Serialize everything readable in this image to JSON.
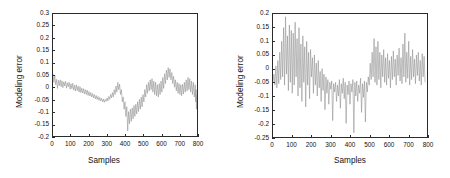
{
  "figure": {
    "background": "#ffffff",
    "trace_color": "#8c8c8c",
    "axis_color": "#2b2b2b"
  },
  "chart_data": [
    {
      "id": "left",
      "type": "line",
      "title": "",
      "xlabel": "Samples",
      "ylabel": "Modeling error",
      "xlim": [
        0,
        800
      ],
      "ylim": [
        -0.2,
        0.3
      ],
      "xticks": [
        0,
        100,
        200,
        300,
        400,
        500,
        600,
        700,
        800
      ],
      "xticklabels": [
        "0",
        "100",
        "200",
        "300",
        "400",
        "500",
        "600",
        "700",
        "800"
      ],
      "yticks": [
        -0.2,
        -0.15,
        -0.1,
        -0.05,
        0,
        0.05,
        0.1,
        0.15,
        0.2,
        0.25,
        0.3
      ],
      "yticklabels": [
        "-0.2",
        "-0.15",
        "-0.1",
        "-0.05",
        "0",
        "0.05",
        "0.1",
        "0.15",
        "0.2",
        "0.25",
        "0.3"
      ],
      "grid": false,
      "legend": null,
      "series": [
        {
          "name": "modeling error",
          "color": "#8c8c8c",
          "x": [
            0,
            5,
            10,
            15,
            20,
            25,
            30,
            35,
            40,
            45,
            50,
            55,
            60,
            65,
            70,
            75,
            80,
            85,
            90,
            95,
            100,
            105,
            110,
            115,
            120,
            125,
            130,
            135,
            140,
            145,
            150,
            155,
            160,
            165,
            170,
            175,
            180,
            185,
            190,
            195,
            200,
            205,
            210,
            215,
            220,
            225,
            230,
            235,
            240,
            245,
            250,
            255,
            260,
            265,
            270,
            275,
            280,
            285,
            290,
            295,
            300,
            305,
            310,
            315,
            320,
            325,
            330,
            335,
            340,
            345,
            350,
            355,
            360,
            365,
            370,
            375,
            380,
            385,
            390,
            395,
            400,
            405,
            410,
            415,
            420,
            425,
            430,
            435,
            440,
            445,
            450,
            455,
            460,
            465,
            470,
            475,
            480,
            485,
            490,
            495,
            500,
            505,
            510,
            515,
            520,
            525,
            530,
            535,
            540,
            545,
            550,
            555,
            560,
            565,
            570,
            575,
            580,
            585,
            590,
            595,
            600,
            605,
            610,
            615,
            620,
            625,
            630,
            635,
            640,
            645,
            650,
            655,
            660,
            665,
            670,
            675,
            680,
            685,
            690,
            695,
            700,
            705,
            710,
            715,
            720,
            725,
            730,
            735,
            740,
            745,
            750,
            755,
            760,
            765,
            770,
            775,
            780,
            785,
            790,
            793,
            795,
            797,
            799
          ],
          "y": [
            0.055,
            0.02,
            0.048,
            0.01,
            0.032,
            -0.005,
            0.028,
            0.006,
            0.03,
            0.002,
            0.026,
            -0.002,
            0.022,
            0.005,
            0.024,
            -0.004,
            0.018,
            0.002,
            0.02,
            -0.008,
            0.014,
            -0.006,
            0.016,
            -0.012,
            0.008,
            -0.016,
            0.01,
            -0.014,
            0.004,
            -0.02,
            0.002,
            -0.022,
            -0.004,
            -0.024,
            -0.006,
            -0.028,
            -0.01,
            -0.03,
            -0.012,
            -0.034,
            -0.018,
            -0.036,
            -0.022,
            -0.04,
            -0.026,
            -0.044,
            -0.03,
            -0.048,
            -0.034,
            -0.05,
            -0.038,
            -0.054,
            -0.042,
            -0.056,
            -0.046,
            -0.06,
            -0.048,
            -0.062,
            -0.05,
            -0.058,
            -0.044,
            -0.056,
            -0.038,
            -0.05,
            -0.03,
            -0.044,
            -0.022,
            -0.04,
            -0.01,
            -0.03,
            0.005,
            -0.02,
            0.02,
            -0.01,
            0.012,
            -0.03,
            -0.01,
            -0.06,
            -0.04,
            -0.09,
            -0.06,
            -0.12,
            -0.08,
            -0.18,
            -0.1,
            -0.15,
            -0.09,
            -0.14,
            -0.085,
            -0.13,
            -0.075,
            -0.12,
            -0.07,
            -0.11,
            -0.06,
            -0.1,
            -0.05,
            -0.09,
            -0.04,
            -0.08,
            -0.03,
            -0.06,
            -0.01,
            -0.04,
            0.01,
            -0.025,
            0.02,
            -0.015,
            0.03,
            -0.01,
            0.035,
            -0.02,
            0.025,
            -0.03,
            0.02,
            -0.035,
            0.01,
            -0.04,
            0.015,
            -0.03,
            0.025,
            -0.02,
            0.04,
            -0.005,
            0.055,
            0.015,
            0.07,
            0.03,
            0.08,
            0.04,
            0.075,
            0.03,
            0.06,
            0.015,
            0.045,
            0.0,
            0.03,
            -0.015,
            0.02,
            -0.025,
            0.015,
            -0.03,
            0.01,
            -0.035,
            0.012,
            -0.028,
            0.02,
            -0.02,
            0.03,
            -0.015,
            0.04,
            -0.01,
            0.035,
            -0.02,
            0.025,
            -0.03,
            0.02,
            -0.04,
            0.01,
            -0.06,
            -0.01,
            -0.09,
            -0.03,
            -0.125,
            -0.05,
            0.01,
            0.05,
            0.09,
            0.06,
            0.1,
            0.18,
            0.3
          ]
        }
      ]
    },
    {
      "id": "right",
      "type": "line",
      "title": "",
      "xlabel": "Samples",
      "ylabel": "Modeling error",
      "xlim": [
        0,
        800
      ],
      "ylim": [
        -0.25,
        0.2
      ],
      "xticks": [
        0,
        100,
        200,
        300,
        400,
        500,
        600,
        700,
        800
      ],
      "xticklabels": [
        "0",
        "100",
        "200",
        "300",
        "400",
        "500",
        "600",
        "700",
        "800"
      ],
      "yticks": [
        -0.25,
        -0.2,
        -0.15,
        -0.1,
        -0.05,
        0,
        0.05,
        0.1,
        0.15,
        0.2
      ],
      "yticklabels": [
        "-0.25",
        "-0.2",
        "-0.15",
        "-0.1",
        "-0.05",
        "0",
        "0.05",
        "0.1",
        "0.15",
        "0.2"
      ],
      "grid": false,
      "legend": null,
      "series": [
        {
          "name": "modeling error",
          "color": "#8c8c8c",
          "x": [
            0,
            5,
            10,
            15,
            20,
            25,
            30,
            35,
            40,
            45,
            50,
            55,
            60,
            65,
            70,
            75,
            80,
            85,
            90,
            95,
            100,
            105,
            110,
            115,
            120,
            125,
            130,
            135,
            140,
            145,
            150,
            155,
            160,
            165,
            170,
            175,
            180,
            185,
            190,
            195,
            200,
            205,
            210,
            215,
            220,
            225,
            230,
            235,
            240,
            245,
            250,
            255,
            260,
            265,
            270,
            275,
            280,
            285,
            290,
            295,
            300,
            305,
            310,
            315,
            320,
            325,
            330,
            335,
            340,
            345,
            350,
            355,
            360,
            365,
            370,
            375,
            380,
            385,
            390,
            395,
            400,
            405,
            410,
            415,
            420,
            425,
            430,
            435,
            440,
            445,
            450,
            455,
            460,
            465,
            470,
            475,
            480,
            485,
            490,
            495,
            500,
            505,
            510,
            515,
            520,
            525,
            530,
            535,
            540,
            545,
            550,
            555,
            560,
            565,
            570,
            575,
            580,
            585,
            590,
            595,
            600,
            605,
            610,
            615,
            620,
            625,
            630,
            635,
            640,
            645,
            650,
            655,
            660,
            665,
            670,
            675,
            680,
            685,
            690,
            695,
            700,
            705,
            710,
            715,
            720,
            725,
            730,
            735,
            740,
            745,
            750,
            755,
            760,
            765,
            770,
            775,
            780,
            785,
            790,
            795,
            799
          ],
          "y": [
            -0.05,
            -0.02,
            -0.06,
            0.01,
            -0.07,
            0.03,
            -0.055,
            0.06,
            -0.04,
            0.1,
            -0.03,
            0.15,
            -0.06,
            0.19,
            -0.02,
            0.12,
            -0.08,
            0.16,
            -0.05,
            0.14,
            -0.09,
            0.13,
            -0.06,
            0.17,
            -0.03,
            0.11,
            -0.1,
            0.15,
            -0.07,
            0.09,
            -0.12,
            0.12,
            -0.05,
            0.08,
            -0.14,
            0.1,
            -0.06,
            0.06,
            -0.11,
            0.07,
            -0.03,
            0.04,
            -0.09,
            0.05,
            -0.06,
            0.02,
            -0.1,
            0.03,
            -0.07,
            -0.01,
            -0.12,
            0.0,
            -0.08,
            -0.02,
            -0.15,
            -0.03,
            -0.09,
            -0.04,
            -0.13,
            -0.05,
            -0.075,
            -0.045,
            -0.19,
            -0.055,
            -0.085,
            -0.05,
            -0.12,
            -0.06,
            -0.1,
            -0.04,
            -0.145,
            -0.055,
            -0.09,
            -0.035,
            -0.11,
            -0.05,
            -0.2,
            -0.06,
            -0.095,
            -0.045,
            -0.13,
            -0.055,
            -0.085,
            -0.04,
            -0.235,
            -0.05,
            -0.1,
            -0.045,
            -0.12,
            -0.06,
            -0.09,
            -0.035,
            -0.16,
            -0.055,
            -0.105,
            -0.045,
            -0.195,
            -0.05,
            -0.085,
            -0.03,
            -0.06,
            0.02,
            -0.04,
            0.06,
            -0.03,
            0.11,
            -0.05,
            0.08,
            -0.06,
            0.1,
            -0.04,
            0.06,
            -0.07,
            0.05,
            -0.03,
            0.07,
            -0.05,
            0.04,
            -0.06,
            0.055,
            -0.035,
            0.03,
            -0.07,
            0.045,
            -0.04,
            0.065,
            -0.03,
            0.035,
            -0.06,
            0.05,
            -0.025,
            0.075,
            -0.045,
            0.04,
            -0.055,
            0.09,
            -0.03,
            0.13,
            -0.05,
            0.06,
            -0.035,
            0.1,
            -0.06,
            0.045,
            -0.04,
            0.07,
            -0.03,
            0.035,
            -0.055,
            0.05,
            -0.025,
            0.06,
            -0.045,
            0.03,
            -0.06,
            0.055,
            -0.03,
            0.045,
            -0.05
          ]
        }
      ]
    }
  ]
}
